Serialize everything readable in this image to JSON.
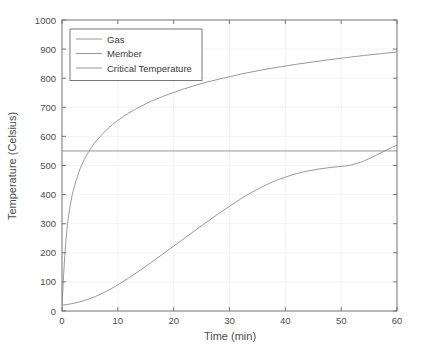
{
  "chart_data": {
    "type": "line",
    "title": "",
    "xlabel": "Time (min)",
    "ylabel": "Temperature (Celsius)",
    "xlim": [
      0,
      60
    ],
    "ylim": [
      0,
      1000
    ],
    "xticks": [
      0,
      10,
      20,
      30,
      40,
      50,
      60
    ],
    "yticks": [
      0,
      100,
      200,
      300,
      400,
      500,
      600,
      700,
      800,
      900,
      1000
    ],
    "grid": true,
    "legend_position": "top-left",
    "series": [
      {
        "name": "Gas",
        "color": "#8c8c8c",
        "x": [
          0,
          0.5,
          1,
          1.5,
          2,
          3,
          4,
          5,
          6,
          8,
          10,
          12,
          14,
          16,
          18,
          20,
          22,
          24,
          26,
          28,
          30,
          33,
          36,
          39,
          42,
          45,
          48,
          51,
          54,
          57,
          60
        ],
        "y": [
          20,
          190,
          300,
          365,
          412,
          476,
          521,
          554,
          581,
          623,
          655,
          681,
          702,
          721,
          737,
          751,
          764,
          776,
          787,
          796,
          805,
          818,
          829,
          839,
          848,
          856,
          864,
          871,
          878,
          884,
          890
        ]
      },
      {
        "name": "Member",
        "color": "#8c8c8c",
        "x": [
          0,
          2,
          4,
          6,
          8,
          10,
          12,
          14,
          16,
          18,
          20,
          22,
          24,
          26,
          28,
          30,
          32,
          34,
          36,
          38,
          40,
          42,
          44,
          46,
          48,
          50,
          51,
          52,
          54,
          56,
          58,
          60
        ],
        "y": [
          20,
          26,
          36,
          50,
          68,
          90,
          114,
          140,
          167,
          195,
          223,
          251,
          279,
          307,
          334,
          360,
          385,
          408,
          428,
          446,
          460,
          472,
          481,
          488,
          493,
          497,
          499,
          503,
          515,
          533,
          552,
          570
        ]
      },
      {
        "name": "Critical Temperature",
        "color": "#8c8c8c",
        "x": [
          0,
          60
        ],
        "y": [
          550,
          550
        ]
      }
    ],
    "legend_entries": [
      "Gas",
      "Member",
      "Critical Temperature"
    ],
    "axis_color": "#6b6b6b",
    "grid_color": "#f0f0f0",
    "text_color": "#4d4d4d",
    "background_color": "#ffffff"
  }
}
